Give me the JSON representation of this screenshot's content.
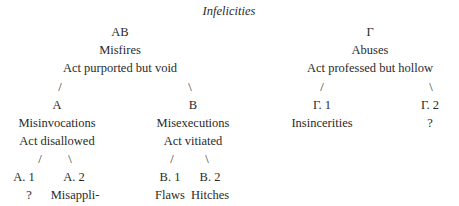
{
  "title": "Infelicities",
  "left_branch": {
    "code": "AB",
    "name": "Misfires",
    "desc": "Act purported but void",
    "slash_left": "/",
    "slash_right": "\\",
    "A": {
      "code": "A",
      "name": "Misinvocations",
      "desc": "Act disallowed",
      "slash_left": "/",
      "slash_right": "\\",
      "A1": {
        "code": "A. 1",
        "name": "?"
      },
      "A2": {
        "code": "A. 2",
        "name_line1": "Misappli-",
        "name_line2": "cations"
      }
    },
    "B": {
      "code": "B",
      "name": "Misexecutions",
      "desc": "Act vitiated",
      "slash_left": "/",
      "slash_right": "\\",
      "B1": {
        "code": "B. 1",
        "name": "Flaws"
      },
      "B2": {
        "code": "B. 2",
        "name": "Hitches"
      }
    }
  },
  "right_branch": {
    "code": "Γ",
    "name": "Abuses",
    "desc": "Act professed but hollow",
    "slash_left": "/",
    "slash_right": "\\",
    "G1": {
      "code": "Γ. 1",
      "name": "Insincerities"
    },
    "G2": {
      "code": "Γ. 2",
      "name": "?"
    }
  }
}
